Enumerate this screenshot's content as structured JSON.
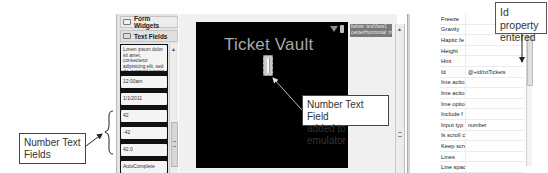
{
  "palette": {
    "categories": [
      {
        "label": "Form Widgets",
        "icon": "folder-closed-icon"
      },
      {
        "label": "Text Fields",
        "icon": "folder-open-icon"
      }
    ],
    "widgets": [
      {
        "label": "Lorem ipsum dolor sit amet, consectetur adipisicing elit, sed do eiusmod tempor",
        "type": "multiline"
      },
      {
        "label": "12:00am",
        "type": "time"
      },
      {
        "label": "1/1/2011",
        "type": "date"
      },
      {
        "label": "42",
        "type": "number"
      },
      {
        "label": "-42",
        "type": "signed-number"
      },
      {
        "label": "42.0",
        "type": "decimal-number"
      },
      {
        "label": "AutoComplete",
        "type": "autocomplete"
      }
    ]
  },
  "emulator": {
    "app_title": "Ticket Vault",
    "status_icons": [
      "signal-icon",
      "battery-icon"
    ]
  },
  "outline_tip": {
    "line1": "below: textView1",
    "line2": "centerHorizontal: true"
  },
  "properties": {
    "rows": [
      {
        "name": "Freeze",
        "value": ""
      },
      {
        "name": "Gravity",
        "value": ""
      },
      {
        "name": "Haptic fe",
        "value": ""
      },
      {
        "name": "Height",
        "value": ""
      },
      {
        "name": "Hint",
        "value": ""
      },
      {
        "name": "Id",
        "value": "@+id/txtTickets"
      },
      {
        "name": "Ime actio",
        "value": ""
      },
      {
        "name": "Ime actio",
        "value": ""
      },
      {
        "name": "Ime optio",
        "value": ""
      },
      {
        "name": "Include f",
        "value": ""
      },
      {
        "name": "Input typ",
        "value": "number"
      },
      {
        "name": "Is scroll c",
        "value": ""
      },
      {
        "name": "Keep scre",
        "value": ""
      },
      {
        "name": "Lines",
        "value": ""
      },
      {
        "name": "Line spac",
        "value": ""
      },
      {
        "name": "Line spac",
        "value": ""
      }
    ]
  },
  "callouts": {
    "id_property": {
      "line1": "Id property",
      "line2": "entered"
    },
    "number_field": {
      "line1": "Number Text Field",
      "line2": "added to emulator"
    },
    "number_fields": {
      "line1": "Number Text",
      "line2": "Fields"
    }
  },
  "colors": {
    "emulator_bg": "#000000",
    "title_text": "#a8a8a8",
    "panel_bg": "#e4e4e4",
    "tooltip_bg": "#7a7a7a"
  }
}
